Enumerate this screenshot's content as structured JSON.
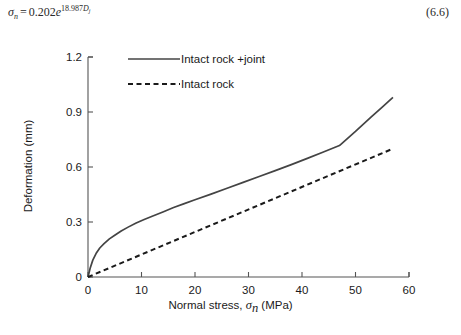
{
  "equation": {
    "lhs_symbol": "σ",
    "lhs_subscript": "n",
    "operator": "=",
    "coefficient": "0.202",
    "base": "e",
    "exponent_coefficient": "18.987",
    "exponent_variable": "D",
    "exponent_variable_subscript": "j",
    "number": "(6.6)"
  },
  "chart_data": {
    "type": "line",
    "title": "",
    "xlabel": "Normal stress, σn (MPa)",
    "xlabel_prefix": "Normal stress, ",
    "xlabel_symbol": "σ",
    "xlabel_symbol_sub": "n",
    "xlabel_suffix": " (MPa)",
    "ylabel": "Deformation (mm)",
    "xlim": [
      0,
      60
    ],
    "ylim": [
      0,
      1.2
    ],
    "xticks": [
      0,
      10,
      20,
      30,
      40,
      50,
      60
    ],
    "xtick_labels": [
      "0",
      "10",
      "20",
      "30",
      "40",
      "50",
      "60"
    ],
    "yticks": [
      0,
      0.3,
      0.6,
      0.9,
      1.2
    ],
    "ytick_labels": [
      "0",
      "0.3",
      "0.6",
      "0.9",
      "1.2"
    ],
    "grid": false,
    "legend_position": "upper-left-inside",
    "series": [
      {
        "name": "Intact rock +joint",
        "style": "solid",
        "color": "#444444",
        "x": [
          0,
          0.4,
          0.9,
          1.5,
          2.2,
          3.0,
          4.0,
          5.0,
          6.2,
          7.5,
          9.0,
          10.5,
          12.0,
          14.0,
          16.0,
          18.0,
          20.0,
          23.0,
          26.0,
          29.0,
          32.0,
          35.0,
          38.0,
          41.0,
          44.0,
          47.0,
          50.0,
          53.0,
          55.0,
          57.0
        ],
        "y": [
          0,
          0.048,
          0.092,
          0.128,
          0.158,
          0.182,
          0.208,
          0.228,
          0.251,
          0.272,
          0.295,
          0.314,
          0.331,
          0.355,
          0.379,
          0.4,
          0.421,
          0.452,
          0.484,
          0.516,
          0.548,
          0.58,
          0.613,
          0.647,
          0.682,
          0.717,
          0.794,
          0.875,
          0.927,
          0.98
        ]
      },
      {
        "name": "Intact rock",
        "style": "dashed",
        "color": "#1a1a1a",
        "x": [
          0,
          57
        ],
        "y": [
          0,
          0.7
        ]
      }
    ]
  },
  "legend": {
    "items": [
      {
        "label": "Intact rock +joint",
        "style": "solid"
      },
      {
        "label": "Intact rock",
        "style": "dashed"
      }
    ]
  }
}
